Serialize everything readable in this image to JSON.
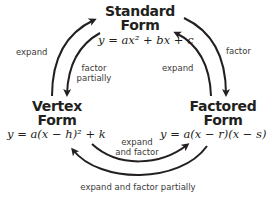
{
  "nodes": {
    "standard": {
      "title_line1": "Standard",
      "title_line2": "Form",
      "equation": "y = ax² + bx + c"
    },
    "vertex": {
      "title_line1": "Vertex",
      "title_line2": "Form",
      "equation": "y = a(x − h)² + k"
    },
    "factored": {
      "title_line1": "Factored",
      "title_line2": "Form",
      "equation": "y = a(x − r)(x − s)"
    }
  },
  "edges": {
    "vertex_to_standard": {
      "label": "expand"
    },
    "standard_to_vertex": {
      "label_line1": "factor",
      "label_line2": "partially"
    },
    "standard_to_factored": {
      "label": "factor"
    },
    "factored_to_standard": {
      "label": "expand"
    },
    "vertex_to_factored": {
      "label_line1": "expand",
      "label_line2": "and factor"
    },
    "factored_to_vertex": {
      "label": "expand and factor partially"
    }
  },
  "colors": {
    "arrow": "#231f20",
    "text": "#231f20",
    "label": "#3a3a3a",
    "background": "#ffffff"
  }
}
